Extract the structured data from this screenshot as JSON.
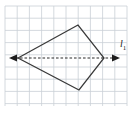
{
  "figure": {
    "type": "geometry-diagram",
    "background_color": "#ffffff",
    "canvas": {
      "width": 136,
      "height": 115
    },
    "grid": {
      "visible": true,
      "color": "#c9cfd6",
      "cell_size": 12.2,
      "origin_x": 5,
      "origin_y": 6,
      "columns": 10,
      "rows": 8
    },
    "shape": {
      "name": "kite",
      "stroke_color": "#3a3a3a",
      "fill": "none",
      "vertices": [
        {
          "name": "left-vertex",
          "x": 18,
          "y": 58
        },
        {
          "name": "top-vertex",
          "x": 78,
          "y": 25
        },
        {
          "name": "right-vertex",
          "x": 104,
          "y": 58
        },
        {
          "name": "bottom-vertex",
          "x": 79,
          "y": 90
        }
      ]
    },
    "symmetry_line": {
      "name": "line-of-symmetry",
      "style": "dashed",
      "color": "#2b2b2b",
      "x_start": 9,
      "x_end": 120,
      "y": 58,
      "arrow_left": true,
      "arrow_right": true,
      "label": "l",
      "label_subscript": "1",
      "label_x": 122,
      "label_y": 44
    }
  }
}
